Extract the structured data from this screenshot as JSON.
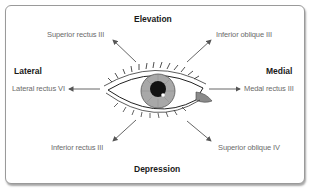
{
  "diagram": {
    "directions": {
      "top": "Elevation",
      "bottom": "Depression",
      "left": "Lateral",
      "right": "Medial"
    },
    "muscles": {
      "top_left": "Superior rectus III",
      "top_right": "Inferior oblique III",
      "left": "Lateral rectus VI",
      "right": "Medal rectus III",
      "bottom_left": "Inferior rectus III",
      "bottom_right": "Superior oblique IV"
    },
    "colors": {
      "frame_border": "#9a9a9a",
      "arrow": "#555555",
      "iris": "#a8a8a8",
      "pupil": "#111111",
      "caruncle": "#8a8a8a",
      "label_text": "#6b6b6b",
      "direction_text": "#1a1a1a"
    }
  }
}
